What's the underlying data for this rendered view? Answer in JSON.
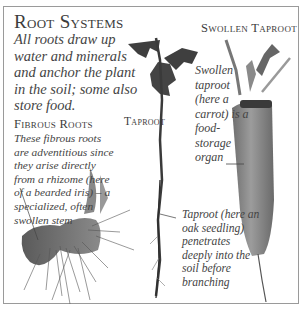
{
  "title": "Root Systems",
  "intro": "All roots draw up water and minerals and anchor the plant in the soil; some also store food.",
  "sections": {
    "fibrous": {
      "heading": "Fibrous Roots",
      "text": "These fibrous roots are adventitious since they arise directly from a rhizome (here of a bearded iris) – a specialized, often swollen stem"
    },
    "taproot": {
      "heading": "Taproot",
      "text": "Taproot (here an oak seedling) penetrates deeply into the soil before branching"
    },
    "swollen_taproot": {
      "heading": "Swollen Taproot",
      "text": "Swollen taproot (here a carrot) is a food-storage organ"
    }
  },
  "illustrations": [
    {
      "name": "iris-rhizome",
      "description": "Bearded iris rhizome with fibrous roots"
    },
    {
      "name": "oak-seedling",
      "description": "Oak seedling with taproot"
    },
    {
      "name": "carrot",
      "description": "Carrot swollen taproot"
    }
  ],
  "colors": {
    "border": "#9a9a9a",
    "text": "#3c3c3c",
    "leaf": "#4a4a4a",
    "carrot": "#8a8a8a"
  }
}
